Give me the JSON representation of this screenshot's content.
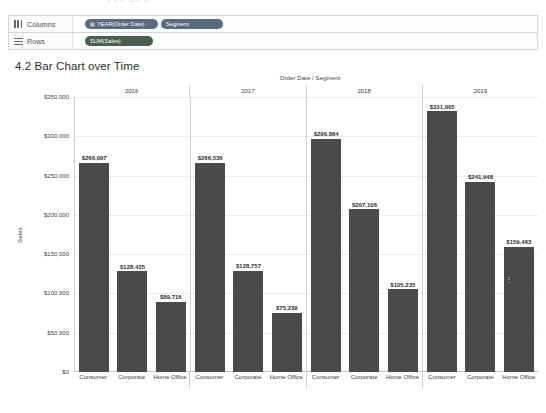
{
  "top_artifact": {
    "ghost_text": "ppy gg g"
  },
  "shelves": [
    {
      "name": "columns",
      "icon": "columns-icon",
      "label": "Columns",
      "pills": [
        {
          "text": "YEAR(Order Date)",
          "icon": "calendar-icon",
          "color": "#5a6b80",
          "width_class": "pill-w1"
        },
        {
          "text": "Segment",
          "icon": "",
          "color": "#5a6b80",
          "width_class": "pill-w2"
        }
      ]
    },
    {
      "name": "rows",
      "icon": "rows-icon",
      "label": "Rows",
      "pills": [
        {
          "text": "SUM(Sales)",
          "icon": "",
          "color": "#4a5f4f",
          "width_class": "pill-w3"
        }
      ]
    }
  ],
  "sheet": {
    "title": "4.2 Bar Chart over Time"
  },
  "chart_data": {
    "type": "bar",
    "title": "Order Date / Segment",
    "xlabel": "Order Date / Segment",
    "ylabel": "Sales",
    "ylim": [
      0,
      350000
    ],
    "ytick_labels": [
      "$350,000",
      "$300,000",
      "$250,000",
      "$200,000",
      "$150,000",
      "$100,000",
      "$50,000",
      "$0"
    ],
    "ytick_values": [
      350000,
      300000,
      250000,
      200000,
      150000,
      100000,
      50000,
      0
    ],
    "grid": true,
    "legend": "none",
    "bar_color": "#4a4a4a",
    "categories": [
      "Consumer",
      "Corporate",
      "Home Office"
    ],
    "groups": [
      {
        "year": "2016",
        "bars": [
          {
            "category": "Consumer",
            "value": 266097,
            "label": "$266,097"
          },
          {
            "category": "Corporate",
            "value": 128435,
            "label": "$128,435"
          },
          {
            "category": "Home Office",
            "value": 89716,
            "label": "$89,716"
          }
        ]
      },
      {
        "year": "2017",
        "bars": [
          {
            "category": "Consumer",
            "value": 266536,
            "label": "$266,536"
          },
          {
            "category": "Corporate",
            "value": 128757,
            "label": "$128,757"
          },
          {
            "category": "Home Office",
            "value": 75239,
            "label": "$75,239"
          }
        ]
      },
      {
        "year": "2018",
        "bars": [
          {
            "category": "Consumer",
            "value": 296864,
            "label": "$296,864"
          },
          {
            "category": "Corporate",
            "value": 207106,
            "label": "$207,106"
          },
          {
            "category": "Home Office",
            "value": 105235,
            "label": "$105,235"
          }
        ]
      },
      {
        "year": "2019",
        "bars": [
          {
            "category": "Consumer",
            "value": 331905,
            "label": "$331,905"
          },
          {
            "category": "Corporate",
            "value": 241948,
            "label": "$241,948"
          },
          {
            "category": "Home Office",
            "value": 159463,
            "label": "$159,463"
          }
        ]
      }
    ]
  }
}
